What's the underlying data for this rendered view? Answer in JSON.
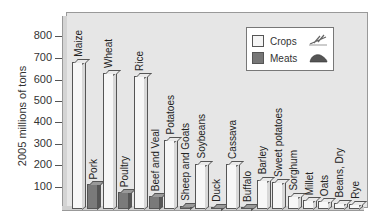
{
  "chart_data": {
    "type": "bar",
    "title": "",
    "xlabel": "",
    "ylabel": "2005 millions of tons",
    "ylim": [
      0,
      850
    ],
    "yticks": [
      100,
      200,
      300,
      400,
      500,
      600,
      700,
      800
    ],
    "grid": false,
    "legend_position": "upper right",
    "legend": [
      {
        "name": "Crops",
        "color": "#f5f5f5",
        "icon": "wheat-icon"
      },
      {
        "name": "Meats",
        "color": "#777777",
        "icon": "steak-icon"
      }
    ],
    "categories": [
      "Maize",
      "Pork",
      "Wheat",
      "Poultry",
      "Rice",
      "Beef and Veal",
      "Potatoes",
      "Sheep and Goats",
      "Soybeans",
      "Duck",
      "Cassava",
      "Buffalo",
      "Barley",
      "Sweet potatoes",
      "Sorghum",
      "Millet",
      "Oats",
      "Beans, Dry",
      "Rye"
    ],
    "bars": [
      {
        "label": "Maize",
        "series": "Crops",
        "value": 680
      },
      {
        "label": "Pork",
        "series": "Meats",
        "value": 115
      },
      {
        "label": "Wheat",
        "series": "Crops",
        "value": 630
      },
      {
        "label": "Poultry",
        "series": "Meats",
        "value": 80
      },
      {
        "label": "Rice",
        "series": "Crops",
        "value": 615
      },
      {
        "label": "Beef and Veal",
        "series": "Meats",
        "value": 60
      },
      {
        "label": "Potatoes",
        "series": "Crops",
        "value": 320
      },
      {
        "label": "Sheep and Goats",
        "series": "Meats",
        "value": 13
      },
      {
        "label": "Soybeans",
        "series": "Crops",
        "value": 210
      },
      {
        "label": "Duck",
        "series": "Meats",
        "value": 4
      },
      {
        "label": "Cassava",
        "series": "Crops",
        "value": 210
      },
      {
        "label": "Buffalo",
        "series": "Meats",
        "value": 3
      },
      {
        "label": "Barley",
        "series": "Crops",
        "value": 135
      },
      {
        "label": "Sweet potatoes",
        "series": "Crops",
        "value": 125
      },
      {
        "label": "Sorghum",
        "series": "Crops",
        "value": 60
      },
      {
        "label": "Millet",
        "series": "Crops",
        "value": 40
      },
      {
        "label": "Oats",
        "series": "Crops",
        "value": 35
      },
      {
        "label": "Beans, Dry",
        "series": "Crops",
        "value": 30
      },
      {
        "label": "Rye",
        "series": "Crops",
        "value": 25
      }
    ]
  }
}
